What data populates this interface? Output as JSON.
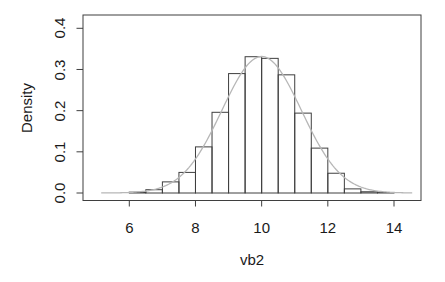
{
  "chart_data": {
    "type": "histogram",
    "title": "",
    "xlabel": "vb2",
    "ylabel": "Density",
    "x_tick_labels": [
      "6",
      "8",
      "10",
      "12",
      "14"
    ],
    "y_tick_labels": [
      "0.0",
      "0.1",
      "0.2",
      "0.3",
      "0.4"
    ],
    "x_tick_values": [
      6,
      8,
      10,
      12,
      14
    ],
    "y_tick_values": [
      0,
      0.1,
      0.2,
      0.3,
      0.4
    ],
    "xlim": [
      4.7,
      14.8
    ],
    "ylim": [
      0,
      0.43
    ],
    "grid": "off",
    "legend": "none",
    "bins": {
      "start": 6.0,
      "width": 0.5,
      "densities": [
        0.002,
        0.008,
        0.027,
        0.05,
        0.112,
        0.196,
        0.29,
        0.331,
        0.327,
        0.287,
        0.194,
        0.109,
        0.048,
        0.01,
        0.003,
        0.001
      ]
    },
    "density_curve": {
      "shape": "normal",
      "mean": 10.0,
      "sd": 1.2,
      "peak_density": 0.3315,
      "x_start": 5.15,
      "x_end": 14.55,
      "color": "#b7b7b7"
    },
    "bar_fill": "none",
    "bar_stroke": "#3f3f3f",
    "axis_color": "#3f3f3f",
    "text_color": "#1a1a1a",
    "background": "#ffffff"
  }
}
